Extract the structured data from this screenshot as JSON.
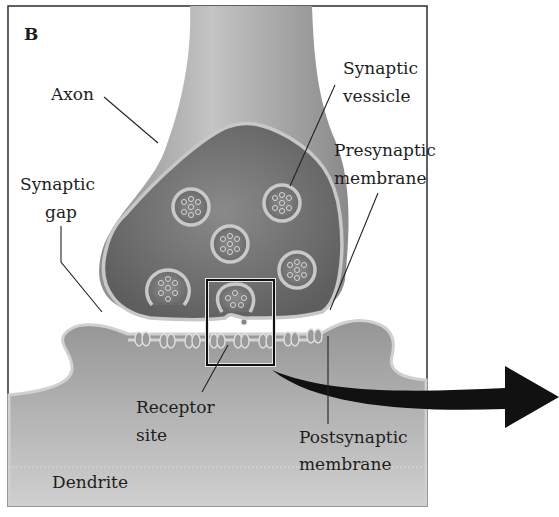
{
  "figure": {
    "panel_label": "B",
    "labels": {
      "axon": "Axon",
      "synaptic_vesicle": [
        "Synaptic",
        "vessicle"
      ],
      "presynaptic_membrane": [
        "Presynaptic",
        "membrane"
      ],
      "synaptic_gap": [
        "Synaptic",
        "gap"
      ],
      "receptor_site": [
        "Receptor",
        "site"
      ],
      "postsynaptic_membrane": [
        "Postsynaptic",
        "membrane"
      ],
      "dendrite": "Dendrite"
    },
    "vesicle_count": 6,
    "receptor_count": 9,
    "highlight_box": "magnified region (release site)",
    "arrow": "arrow pointing right to magnified view",
    "colors": {
      "background": "#ffffff",
      "frame": "#3a3a3a",
      "axon_light": "#b8b8b8",
      "terminal_dark": "#6e6e6e",
      "membrane": "#c9c9c9",
      "dendrite": "#a8a8a8",
      "arrow": "#111111",
      "text": "#1e1e1e"
    }
  }
}
